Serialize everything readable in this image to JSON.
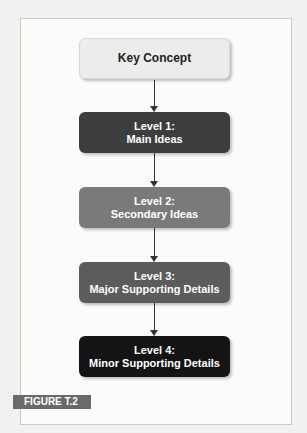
{
  "diagram": {
    "type": "hierarchy-flow",
    "nodes": [
      {
        "id": "key",
        "line1": "Key Concept",
        "line2": "",
        "color": "#ececea"
      },
      {
        "id": "level1",
        "line1": "Level 1:",
        "line2": "Main Ideas",
        "color": "#3d3d3d"
      },
      {
        "id": "level2",
        "line1": "Level 2:",
        "line2": "Secondary Ideas",
        "color": "#7a7a7a"
      },
      {
        "id": "level3",
        "line1": "Level 3:",
        "line2": "Major Supporting Details",
        "color": "#5c5c5c"
      },
      {
        "id": "level4",
        "line1": "Level 4:",
        "line2": "Minor Supporting Details",
        "color": "#141414"
      }
    ],
    "edges": [
      [
        "key",
        "level1"
      ],
      [
        "level1",
        "level2"
      ],
      [
        "level2",
        "level3"
      ],
      [
        "level3",
        "level4"
      ]
    ]
  },
  "figure_label": "FIGURE T.2"
}
